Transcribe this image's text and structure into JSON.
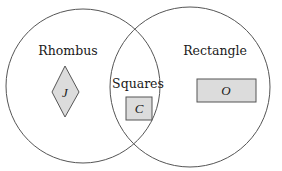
{
  "diagram": {
    "type": "venn",
    "sets": [
      {
        "name": "Rhombus",
        "label": "Rhombus"
      },
      {
        "name": "Rectangle",
        "label": "Rectangle"
      }
    ],
    "intersection": {
      "label": "Squares"
    },
    "members": {
      "rhombus_only": {
        "shape": "diamond",
        "letter": "J"
      },
      "intersection": {
        "shape": "square",
        "letter": "C"
      },
      "rectangle_only": {
        "shape": "rectangle",
        "letter": "O"
      }
    },
    "colors": {
      "stroke": "#555555",
      "shape_fill": "#dcdcdc",
      "background": "#ffffff"
    }
  }
}
